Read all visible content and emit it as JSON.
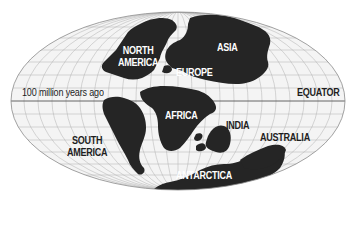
{
  "map": {
    "title": "100 million years ago",
    "projection": "mollweide-style ellipse",
    "equator_label": "EQUATOR",
    "colors": {
      "ocean": "#f4f4f4",
      "land": "#252525",
      "grid": "#a8a8a8",
      "outline": "#8a8a8a",
      "equator_line": "#555555",
      "label_on_land": "#ffffff",
      "label_on_ocean": "#1e1e1e"
    },
    "continents": [
      {
        "name": "NORTH AMERICA",
        "line1": "NORTH",
        "line2": "AMERICA"
      },
      {
        "name": "ASIA",
        "line1": "ASIA"
      },
      {
        "name": "EUROPE",
        "line1": "EUROPE"
      },
      {
        "name": "AFRICA",
        "line1": "AFRICA"
      },
      {
        "name": "SOUTH AMERICA",
        "line1": "SOUTH",
        "line2": "AMERICA"
      },
      {
        "name": "INDIA",
        "line1": "INDIA"
      },
      {
        "name": "AUSTRALIA",
        "line1": "AUSTRALIA"
      },
      {
        "name": "ANTARCTICA",
        "line1": "ANTARCTICA"
      }
    ]
  }
}
